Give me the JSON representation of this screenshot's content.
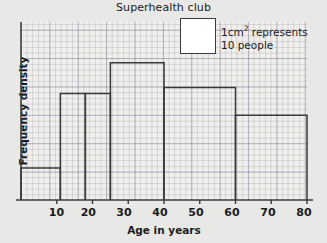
{
  "chart_data": {
    "type": "bar",
    "title": "Superhealth club",
    "xlabel": "Age in years",
    "ylabel": "Frequency density",
    "xlim": [
      0,
      80
    ],
    "ylim": [
      0,
      6.3
    ],
    "grid": true,
    "xticks": [
      10,
      20,
      30,
      40,
      50,
      60,
      70,
      80
    ],
    "xtick_labels": [
      "10",
      "20",
      "30",
      "40",
      "50",
      "60",
      "70",
      "80"
    ],
    "yticks": [],
    "ytick_labels": [],
    "bins": [
      {
        "label": "0-11",
        "x_start": 0,
        "x_end": 11,
        "frequency_density": 1.13
      },
      {
        "label": "11-18",
        "x_start": 11,
        "x_end": 18,
        "frequency_density": 3.77
      },
      {
        "label": "18-25",
        "x_start": 18,
        "x_end": 25,
        "frequency_density": 3.77
      },
      {
        "label": "25-40",
        "x_start": 25,
        "x_end": 40,
        "frequency_density": 4.86
      },
      {
        "label": "40-60",
        "x_start": 40,
        "x_end": 60,
        "frequency_density": 3.98
      },
      {
        "label": "60-80",
        "x_start": 60,
        "x_end": 80,
        "frequency_density": 3.0
      }
    ],
    "legend": {
      "position": "top-right",
      "swatch_color": "#ffffff",
      "line1": "1cm",
      "line1_sup": "2",
      "line1_rest": " represents",
      "line2": "10 people"
    },
    "colors": {
      "background": "#e8e8e6",
      "plot_background": "#f0efec",
      "grid": "#9696a5",
      "axis": "#3a3a3a",
      "bar_outline": "#3a3a3a",
      "text": "#1b1b1b"
    }
  }
}
